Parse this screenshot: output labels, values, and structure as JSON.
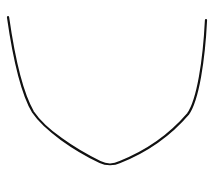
{
  "canvas": {
    "width": 220,
    "height": 169,
    "background": "#ffffff"
  },
  "drawing": {
    "shape": "u-shaped-curve",
    "stroke_color": "#111111",
    "stroke_width": 2.2,
    "path": "M 8 17 C 12 45, 20 90, 33 112 C 45 130, 75 150, 100 162 C 106 165, 114 165, 120 162 C 145 152, 170 135, 188 114 C 198 100, 204 60, 206 20"
  }
}
